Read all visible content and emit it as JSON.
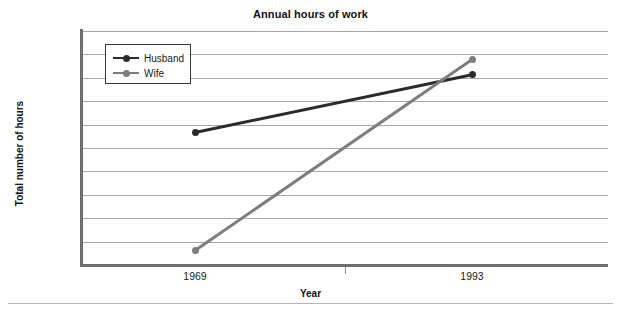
{
  "chart_data": {
    "type": "line",
    "title": "Annual hours of work",
    "xlabel": "Year",
    "ylabel": "Total number of hours",
    "categories": [
      "1969",
      "1993"
    ],
    "x_tick_labels": [
      "1969",
      "1993"
    ],
    "y_tick_labels": [
      "3,400",
      "3,300",
      "3,200",
      "3,100",
      "3,000",
      "2,900",
      "2,800",
      "2,700",
      "2,600",
      "2,500",
      "2,400"
    ],
    "ylim": [
      2400,
      3400
    ],
    "y_tick_step": 100,
    "grid": "horizontal",
    "legend_position": "top-left-inside",
    "series": [
      {
        "name": "Husband",
        "color": "#2b2b2b",
        "values": [
          2965,
          3212
        ]
      },
      {
        "name": "Wife",
        "color": "#7d7d7d",
        "values": [
          2462,
          3278
        ]
      }
    ]
  },
  "legend": {
    "entries": [
      {
        "label": "Husband"
      },
      {
        "label": "Wife"
      }
    ]
  },
  "caption": {
    "text": ""
  }
}
